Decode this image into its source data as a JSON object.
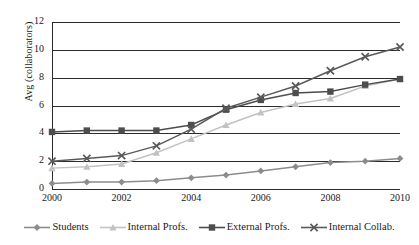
{
  "chart_data": {
    "type": "line",
    "title": "",
    "xlabel": "",
    "ylabel": "Avg (collaborators)",
    "x": [
      2000,
      2001,
      2002,
      2003,
      2004,
      2005,
      2006,
      2007,
      2008,
      2009,
      2010
    ],
    "xtick_labels": [
      "2000",
      "2002",
      "2004",
      "2006",
      "2008",
      "2010"
    ],
    "xtick_values": [
      2000,
      2002,
      2004,
      2006,
      2008,
      2010
    ],
    "ytick_labels": [
      "0",
      "2",
      "4",
      "6",
      "8",
      "10",
      "12"
    ],
    "ytick_values": [
      0,
      2,
      4,
      6,
      8,
      10,
      12
    ],
    "xlim": [
      2000,
      2010
    ],
    "ylim": [
      0,
      12
    ],
    "grid": true,
    "legend_position": "bottom",
    "series": [
      {
        "name": "Students",
        "marker": "diamond",
        "color": "#8c8c8c",
        "values": [
          0.4,
          0.5,
          0.5,
          0.6,
          0.8,
          1.0,
          1.3,
          1.6,
          1.9,
          2.0,
          2.2
        ]
      },
      {
        "name": "Internal Profs.",
        "marker": "triangle",
        "color": "#c2c2c2",
        "values": [
          1.5,
          1.6,
          1.8,
          2.6,
          3.6,
          4.6,
          5.5,
          6.1,
          6.5,
          7.4,
          7.9
        ]
      },
      {
        "name": "External Profs.",
        "marker": "square",
        "color": "#4d4d4d",
        "values": [
          4.1,
          4.2,
          4.2,
          4.2,
          4.6,
          5.7,
          6.4,
          6.9,
          7.0,
          7.5,
          7.9
        ]
      },
      {
        "name": "Internal Collab.",
        "marker": "cross",
        "color": "#5a5a5a",
        "values": [
          2.0,
          2.2,
          2.4,
          3.1,
          4.3,
          5.8,
          6.6,
          7.4,
          8.5,
          9.5,
          10.2
        ]
      }
    ]
  }
}
